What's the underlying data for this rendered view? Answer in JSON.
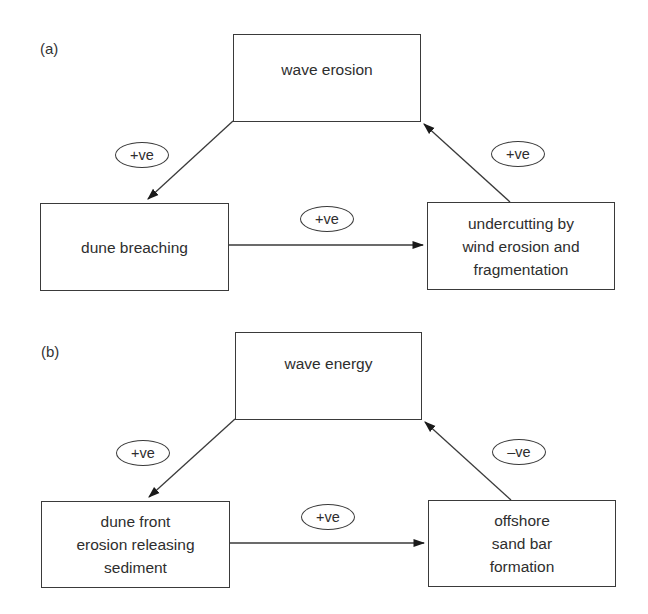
{
  "diagrams": [
    {
      "panel_label": "(a)",
      "nodes": {
        "top": "wave erosion",
        "left": "dune breaching",
        "right": "undercutting by\nwind erosion and\nfragmentation"
      },
      "links": {
        "top_to_left": "+ve",
        "left_to_right": "+ve",
        "right_to_top": "+ve"
      }
    },
    {
      "panel_label": "(b)",
      "nodes": {
        "top": "wave energy",
        "left": "dune front\nerosion releasing\nsediment",
        "right": "offshore\nsand bar\nformation"
      },
      "links": {
        "top_to_left": "+ve",
        "left_to_right": "+ve",
        "right_to_top": "–ve"
      }
    }
  ],
  "colors": {
    "line": "#3a3a3a",
    "text": "#2e2e2e",
    "background": "#ffffff"
  }
}
